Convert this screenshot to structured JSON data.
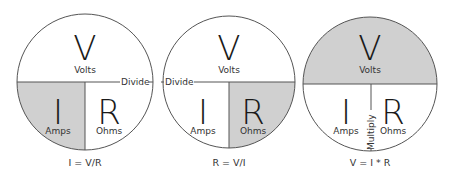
{
  "colors": {
    "shade": "#d0d0d0",
    "stroke": "#555555",
    "text": "#1a1a1a",
    "background": "#ffffff"
  },
  "circles": [
    {
      "highlight": "I",
      "top": {
        "letter": "V",
        "unit": "Volts"
      },
      "bottom_left": {
        "letter": "I",
        "unit": "Amps"
      },
      "bottom_right": {
        "letter": "R",
        "unit": "Ohms"
      },
      "operator_label": "Divide",
      "equation": "I = V/R"
    },
    {
      "highlight": "R",
      "top": {
        "letter": "V",
        "unit": "Volts"
      },
      "bottom_left": {
        "letter": "I",
        "unit": "Amps"
      },
      "bottom_right": {
        "letter": "R",
        "unit": "Ohms"
      },
      "operator_label": "Divide",
      "equation": "R = V/I"
    },
    {
      "highlight": "V",
      "top": {
        "letter": "V",
        "unit": "Volts"
      },
      "bottom_left": {
        "letter": "I",
        "unit": "Amps"
      },
      "bottom_right": {
        "letter": "R",
        "unit": "Ohms"
      },
      "operator_label": "Multiply",
      "equation": "V = I * R"
    }
  ]
}
